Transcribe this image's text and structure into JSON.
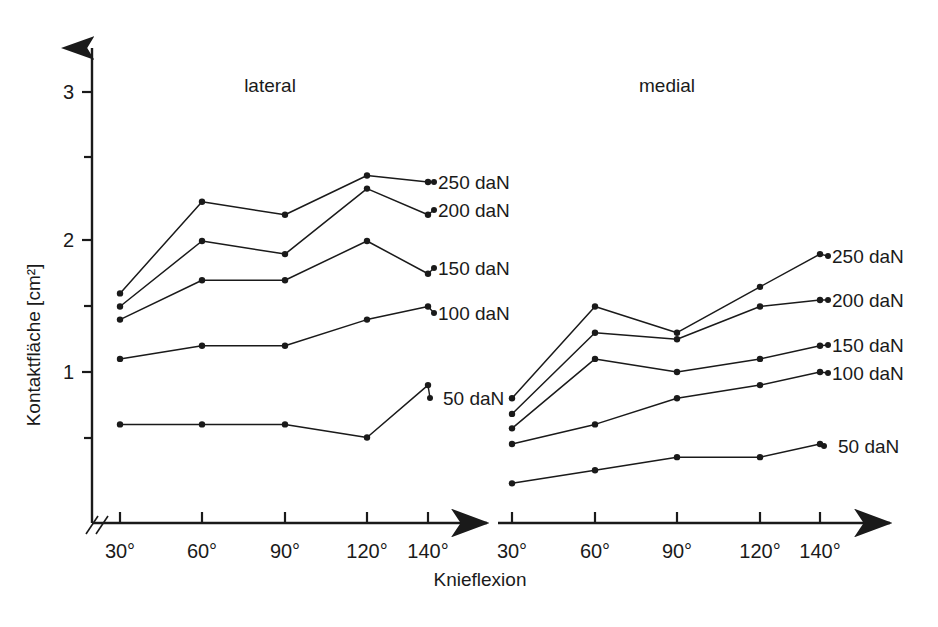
{
  "figure": {
    "y_axis_title": "Kontaktfläche [cm²]",
    "x_axis_title": "Knieflexion",
    "panels": [
      {
        "name": "lateral",
        "title": "lateral"
      },
      {
        "name": "medial",
        "title": "medial"
      }
    ],
    "y_ticks_major": [
      "1",
      "2",
      "3"
    ],
    "x_ticks": [
      "30°",
      "60°",
      "90°",
      "120°",
      "140°"
    ],
    "series_labels": [
      "250 daN",
      "200 daN",
      "150 daN",
      "100 daN",
      "50 daN"
    ],
    "axis_break_symbol": "//"
  },
  "chart_data": {
    "type": "line",
    "title": "",
    "xlabel": "Knieflexion",
    "ylabel": "Kontaktfläche [cm²]",
    "ylim": [
      0,
      3.2
    ],
    "y_ticks_major": [
      1,
      2,
      3
    ],
    "y_ticks_minor": [
      0.5,
      1.5,
      2.5
    ],
    "grid": false,
    "legend_position": "right-of-each-panel (inline end labels)",
    "x": [
      "30°",
      "60°",
      "90°",
      "120°",
      "140°"
    ],
    "panels": [
      {
        "name": "lateral",
        "series": [
          {
            "name": "250 daN",
            "values": [
              1.6,
              2.3,
              2.2,
              2.5,
              2.45
            ]
          },
          {
            "name": "200 daN",
            "values": [
              1.5,
              2.0,
              1.9,
              2.4,
              2.2
            ]
          },
          {
            "name": "150 daN",
            "values": [
              1.4,
              1.7,
              1.7,
              2.0,
              1.75
            ]
          },
          {
            "name": "100 daN",
            "values": [
              1.1,
              1.2,
              1.2,
              1.4,
              1.5
            ]
          },
          {
            "name": "50 daN",
            "values": [
              0.6,
              0.6,
              0.6,
              0.5,
              0.9
            ]
          }
        ]
      },
      {
        "name": "medial",
        "series": [
          {
            "name": "250 daN",
            "values": [
              0.8,
              1.5,
              1.3,
              1.65,
              1.9
            ]
          },
          {
            "name": "200 daN",
            "values": [
              0.68,
              1.3,
              1.25,
              1.5,
              1.55
            ]
          },
          {
            "name": "150 daN",
            "values": [
              0.57,
              1.1,
              1.0,
              1.1,
              1.2
            ]
          },
          {
            "name": "100 daN",
            "values": [
              0.45,
              0.6,
              0.8,
              0.9,
              1.0
            ]
          },
          {
            "name": "50 daN",
            "values": [
              0.15,
              0.25,
              0.35,
              0.35,
              0.45
            ]
          }
        ]
      }
    ]
  }
}
